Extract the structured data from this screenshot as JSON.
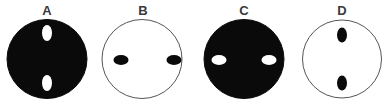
{
  "figure": {
    "panels": [
      {
        "label": "A",
        "disc_fill": "#0a0a0a",
        "disc_stroke": "#0a0a0a",
        "hole_fill": "#ffffff",
        "hole_orientation": "vertical",
        "holes": [
          {
            "cx": 40,
            "cy": 16,
            "rx": 5,
            "ry": 8
          },
          {
            "cx": 40,
            "cy": 66,
            "rx": 5,
            "ry": 8
          }
        ]
      },
      {
        "label": "B",
        "disc_fill": "#ffffff",
        "disc_stroke": "#555555",
        "hole_fill": "#0a0a0a",
        "hole_orientation": "horizontal",
        "holes": [
          {
            "cx": 21,
            "cy": 43,
            "rx": 7.5,
            "ry": 5
          },
          {
            "cx": 74,
            "cy": 43,
            "rx": 7.5,
            "ry": 5
          }
        ]
      },
      {
        "label": "C",
        "disc_fill": "#0a0a0a",
        "disc_stroke": "#0a0a0a",
        "hole_fill": "#ffffff",
        "hole_orientation": "horizontal",
        "holes": [
          {
            "cx": 23,
            "cy": 43,
            "rx": 7.5,
            "ry": 5
          },
          {
            "cx": 73,
            "cy": 43,
            "rx": 7.5,
            "ry": 5
          }
        ]
      },
      {
        "label": "D",
        "disc_fill": "#ffffff",
        "disc_stroke": "#555555",
        "hole_fill": "#0a0a0a",
        "hole_orientation": "vertical",
        "holes": [
          {
            "cx": 47,
            "cy": 18,
            "rx": 5,
            "ry": 7.5
          },
          {
            "cx": 47,
            "cy": 66,
            "rx": 5,
            "ry": 7.5
          }
        ]
      }
    ]
  }
}
